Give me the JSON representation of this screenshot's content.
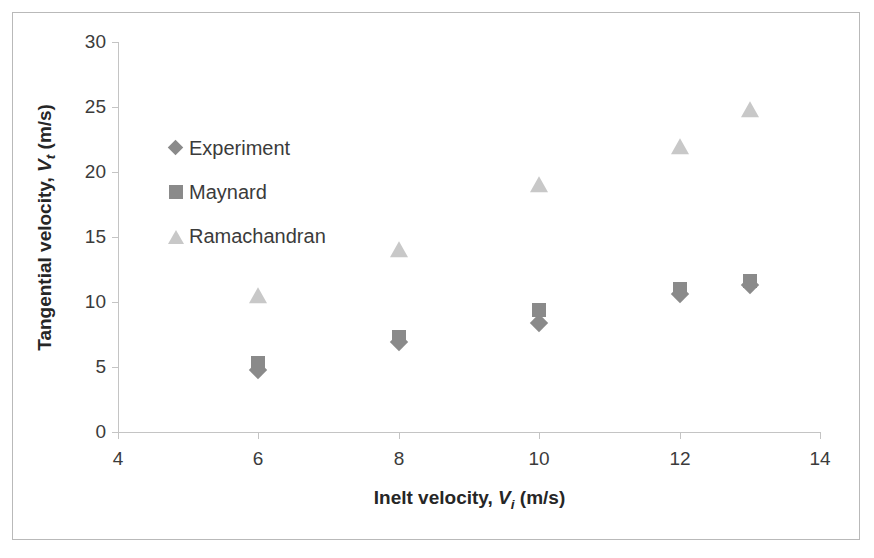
{
  "chart_data": {
    "type": "scatter",
    "title": "",
    "xlabel": "Inelt velocity, Vi (m/s)",
    "ylabel": "Tangential velocity, Vt (m/s)",
    "xlabel_parts": {
      "prefix": "Inelt velocity, ",
      "symbol": "V",
      "subscript": "i",
      "suffix": " (m/s)"
    },
    "ylabel_parts": {
      "prefix": "Tangential velocity, ",
      "symbol": "V",
      "subscript": "t",
      "suffix": " (m/s)"
    },
    "xlim": [
      4,
      14
    ],
    "ylim": [
      0,
      30
    ],
    "xticks": [
      4,
      6,
      8,
      10,
      12,
      14
    ],
    "yticks": [
      0,
      5,
      10,
      15,
      20,
      25,
      30
    ],
    "xtick_labels": [
      "4",
      "6",
      "8",
      "10",
      "12",
      "14"
    ],
    "ytick_labels": [
      "0",
      "5",
      "10",
      "15",
      "20",
      "25",
      "30"
    ],
    "grid": false,
    "legend_position": "inside-upper-left",
    "series": [
      {
        "name": "Experiment",
        "marker": "diamond",
        "color": "#8a8a8a",
        "x": [
          6,
          8,
          10,
          12,
          13
        ],
        "values": [
          4.8,
          6.9,
          8.4,
          10.6,
          11.3
        ]
      },
      {
        "name": "Maynard",
        "marker": "square",
        "color": "#8a8a8a",
        "x": [
          6,
          8,
          10,
          12,
          13
        ],
        "values": [
          5.3,
          7.3,
          9.4,
          11.0,
          11.6
        ]
      },
      {
        "name": "Ramachandran",
        "marker": "triangle",
        "color": "#c8c8c8",
        "x": [
          6,
          8,
          10,
          12,
          13
        ],
        "values": [
          10.5,
          14.0,
          19.0,
          21.9,
          24.8
        ]
      }
    ]
  },
  "legend": {
    "items": [
      {
        "label": "Experiment",
        "marker": "diamond",
        "color": "#8a8a8a"
      },
      {
        "label": "Maynard",
        "marker": "square",
        "color": "#8a8a8a"
      },
      {
        "label": "Ramachandran",
        "marker": "triangle",
        "color": "#c8c8c8"
      }
    ]
  },
  "style": {
    "axis_color": "#c4c4c4",
    "text_color": "#3b3b3b",
    "frame_color": "#b9b9b9",
    "background": "#ffffff"
  }
}
